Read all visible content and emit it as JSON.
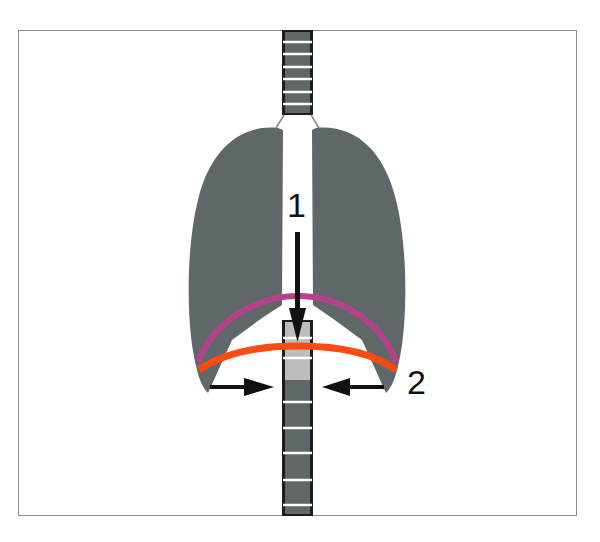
{
  "diagram": {
    "title": "",
    "type": "respiration-mechanics-illustration",
    "labels": [
      {
        "id": "1",
        "text": "1",
        "meaning": "diaphragm moves down (vertical arrow)"
      },
      {
        "id": "2",
        "text": "2",
        "meaning": "rib cage contracts inward (horizontal arrows)"
      }
    ],
    "components": {
      "trachea_spine": {
        "segments_top": 7,
        "segments_bottom": 5,
        "color": "#5f6769"
      },
      "lungs": {
        "count": 2,
        "color": "#5f6769"
      },
      "diaphragm_arcs": [
        {
          "name": "upper-arc",
          "color": "#b0458c"
        },
        {
          "name": "lower-arc",
          "color": "#ff4a12"
        }
      ],
      "arrows": [
        {
          "name": "down-arrow",
          "direction": "down"
        },
        {
          "name": "left-arrow-pointing-right",
          "direction": "right"
        },
        {
          "name": "right-arrow-pointing-left",
          "direction": "left"
        }
      ]
    }
  }
}
